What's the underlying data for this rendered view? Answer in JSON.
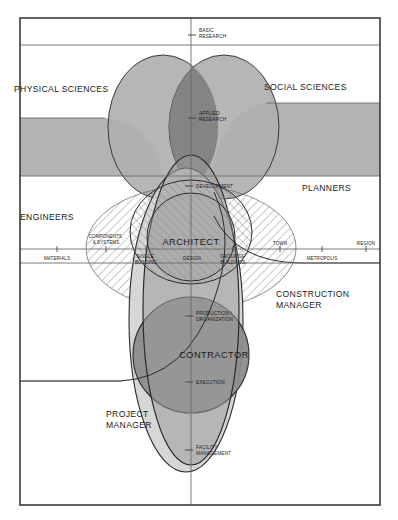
{
  "diagram": {
    "type": "venn-overlap",
    "title_visible": false,
    "frame": {
      "x": 20,
      "y": 18,
      "w": 360,
      "h": 487
    },
    "colors": {
      "band_gray": "#b3b3b3",
      "lobe_gray": "#b0b0b0",
      "lobe_overlap": "#8f8f8f",
      "contractor_gray": "#8c8c8c",
      "project_manager_gray": "#d4d4d4",
      "architect_hatch": "#9a9a9a",
      "construction_manager_hatch": "#8a8a8a",
      "stroke": "#2a2a2a",
      "thin_rule": "#6b6b6b",
      "text": "#1a1a1a",
      "background": "#ffffff"
    },
    "quadrant_labels": [
      {
        "id": "physical-sciences",
        "text": "PHYSICAL SCIENCES",
        "x": 14,
        "y": 88,
        "size": 8.5,
        "anchor": "start"
      },
      {
        "id": "social-sciences",
        "text": "SOCIAL SCIENCES",
        "x": 265,
        "y": 88,
        "size": 8.5,
        "anchor": "start"
      },
      {
        "id": "engineers",
        "text": "ENGINEERS",
        "x": 20,
        "y": 217,
        "size": 8.5,
        "anchor": "start"
      },
      {
        "id": "planners",
        "text": "PLANNERS",
        "x": 303,
        "y": 188,
        "size": 8.5,
        "anchor": "start"
      }
    ],
    "role_labels": [
      {
        "id": "architect",
        "text": "ARCHITECT",
        "x": 191,
        "y": 244,
        "size": 9,
        "anchor": "middle"
      },
      {
        "id": "contractor",
        "text": "CONTRACTOR",
        "x": 214,
        "y": 356,
        "size": 9,
        "anchor": "middle"
      },
      {
        "id": "construction-manager",
        "lines": [
          "CONSTRUCTION",
          "MANAGER"
        ],
        "x": 276,
        "y": 296,
        "size": 8.5,
        "anchor": "start"
      },
      {
        "id": "project-manager",
        "lines": [
          "PROJECT",
          "MANAGER"
        ],
        "x": 106,
        "y": 415,
        "size": 8.5,
        "anchor": "start"
      }
    ],
    "vertical_axis": {
      "name": "process-axis",
      "x": 191,
      "ticks": [
        {
          "id": "basic-research",
          "lines": [
            "BASIC",
            "RESEARCH"
          ],
          "y": 30,
          "size": 4.6
        },
        {
          "id": "applied-research",
          "lines": [
            "APPLIED",
            "RESEARCH"
          ],
          "y": 113,
          "size": 4.6
        },
        {
          "id": "development",
          "lines": [
            "DEVELOPMENT"
          ],
          "y": 186,
          "size": 4.6
        },
        {
          "id": "production-organization",
          "lines": [
            "PRODUCTION /",
            "ORGANIZATION"
          ],
          "y": 313,
          "size": 4.6
        },
        {
          "id": "execution",
          "lines": [
            "EXECUTION"
          ],
          "y": 382,
          "size": 4.6
        },
        {
          "id": "facility-management",
          "lines": [
            "FACILITY",
            "MANAGEMENT"
          ],
          "y": 447,
          "size": 4.6
        }
      ]
    },
    "horizontal_axis": {
      "name": "scale-axis",
      "y_upper_rule": 249,
      "y_lower_rule": 263,
      "upper_ticks": [
        {
          "id": "components-systems",
          "lines": [
            "COMPONENTS",
            "& SYSTEMS"
          ],
          "x": 106,
          "y": 240,
          "size": 4.4,
          "anchor": "middle"
        },
        {
          "id": "town",
          "lines": [
            "TOWN"
          ],
          "x": 280,
          "y": 245,
          "size": 4.4,
          "anchor": "middle"
        },
        {
          "id": "region",
          "lines": [
            "REGION"
          ],
          "x": 366,
          "y": 245,
          "size": 4.4,
          "anchor": "middle"
        }
      ],
      "lower_ticks": [
        {
          "id": "materials",
          "lines": [
            "MATERIALS"
          ],
          "x": 57,
          "y": 259,
          "size": 4.4,
          "anchor": "middle"
        },
        {
          "id": "single-building",
          "lines": [
            "SINGLE",
            "BUILDING"
          ],
          "x": 146,
          "y": 257,
          "size": 4.4,
          "anchor": "middle"
        },
        {
          "id": "design",
          "lines": [
            "DESIGN"
          ],
          "x": 192,
          "y": 259,
          "size": 4.4,
          "anchor": "middle"
        },
        {
          "id": "group-of-buildings",
          "lines": [
            "GROUP OF",
            "BUILDINGS"
          ],
          "x": 233,
          "y": 257,
          "size": 4.4,
          "anchor": "middle"
        },
        {
          "id": "metropolis",
          "lines": [
            "METROPOLIS"
          ],
          "x": 322,
          "y": 259,
          "size": 4.4,
          "anchor": "middle"
        }
      ]
    }
  }
}
